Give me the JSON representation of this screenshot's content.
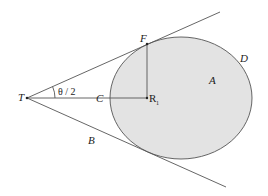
{
  "diagram": {
    "type": "geometry",
    "colors": {
      "line": "#555555",
      "fill": "#e3e3e3",
      "text": "#222222",
      "background": "#ffffff"
    },
    "labels": {
      "T": "T",
      "F": "F",
      "D": "D",
      "A": "A",
      "C": "C",
      "R": "R",
      "R_sub": "1",
      "B": "B",
      "angle": "θ / 2"
    },
    "points": {
      "T": [
        27,
        98
      ],
      "F": [
        147,
        44
      ],
      "R1": [
        147,
        98
      ],
      "C": [
        110,
        98
      ]
    },
    "ellipse": {
      "cx": 181,
      "cy": 98,
      "rx": 71,
      "ry": 61
    },
    "tangent_top_end": [
      220,
      12
    ],
    "tangent_bottom_end": [
      226,
      187
    ]
  }
}
